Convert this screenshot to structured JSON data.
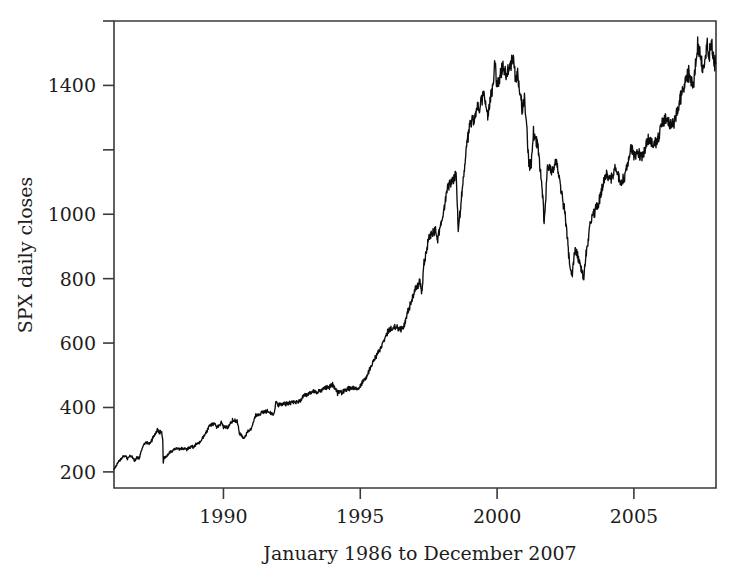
{
  "chart_data": {
    "type": "line",
    "title": "",
    "xlabel": "January 1986 to December 2007",
    "ylabel": "SPX daily closes",
    "grid": false,
    "legend": "none",
    "xlim": [
      1986.0,
      2008.0
    ],
    "ylim": [
      150,
      1600
    ],
    "x_ticks": [
      1990,
      1995,
      2000,
      2005
    ],
    "x_tick_labels": [
      "1990",
      "1995",
      "2000",
      "2005"
    ],
    "y_ticks": [
      200,
      400,
      600,
      800,
      1000,
      1200,
      1400,
      1600
    ],
    "y_tick_labels": [
      "200",
      "400",
      "600",
      "800",
      "1000",
      "",
      "1400",
      ""
    ],
    "series": [
      {
        "name": "SPX daily closes",
        "color": "#0d0d0d",
        "x": [
          1986.0,
          1986.08,
          1986.17,
          1986.25,
          1986.33,
          1986.42,
          1986.5,
          1986.58,
          1986.67,
          1986.75,
          1986.83,
          1986.92,
          1987.0,
          1987.08,
          1987.17,
          1987.25,
          1987.33,
          1987.5,
          1987.58,
          1987.67,
          1987.72,
          1987.78,
          1987.8,
          1987.83,
          1987.92,
          1988.0,
          1988.17,
          1988.33,
          1988.5,
          1988.67,
          1988.83,
          1988.92,
          1989.0,
          1989.17,
          1989.33,
          1989.5,
          1989.67,
          1989.75,
          1989.83,
          1989.92,
          1990.0,
          1990.17,
          1990.33,
          1990.5,
          1990.58,
          1990.75,
          1990.83,
          1990.92,
          1991.0,
          1991.17,
          1991.33,
          1991.5,
          1991.67,
          1991.83,
          1991.92,
          1992.0,
          1992.25,
          1992.5,
          1992.75,
          1992.92,
          1993.0,
          1993.25,
          1993.5,
          1993.75,
          1993.92,
          1994.0,
          1994.17,
          1994.25,
          1994.33,
          1994.5,
          1994.75,
          1994.92,
          1995.0,
          1995.25,
          1995.5,
          1995.75,
          1995.92,
          1996.0,
          1996.25,
          1996.5,
          1996.58,
          1996.75,
          1996.92,
          1997.0,
          1997.17,
          1997.25,
          1997.33,
          1997.5,
          1997.67,
          1997.75,
          1997.83,
          1997.92,
          1998.0,
          1998.17,
          1998.33,
          1998.5,
          1998.58,
          1998.67,
          1998.75,
          1998.83,
          1998.92,
          1999.0,
          1999.17,
          1999.25,
          1999.33,
          1999.5,
          1999.67,
          1999.75,
          1999.83,
          1999.92,
          2000.0,
          2000.17,
          2000.25,
          2000.33,
          2000.42,
          2000.58,
          2000.67,
          2000.75,
          2000.83,
          2000.92,
          2001.0,
          2001.17,
          2001.25,
          2001.33,
          2001.5,
          2001.67,
          2001.72,
          2001.83,
          2001.92,
          2002.0,
          2002.17,
          2002.33,
          2002.5,
          2002.58,
          2002.67,
          2002.75,
          2002.83,
          2002.92,
          2003.0,
          2003.17,
          2003.25,
          2003.42,
          2003.58,
          2003.75,
          2003.92,
          2004.0,
          2004.17,
          2004.33,
          2004.5,
          2004.67,
          2004.83,
          2004.92,
          2005.0,
          2005.17,
          2005.33,
          2005.5,
          2005.67,
          2005.83,
          2005.92,
          2006.0,
          2006.17,
          2006.33,
          2006.42,
          2006.58,
          2006.75,
          2006.92,
          2007.0,
          2007.17,
          2007.33,
          2007.42,
          2007.5,
          2007.58,
          2007.67,
          2007.75,
          2007.83,
          2007.92,
          2007.99
        ],
        "y": [
          209,
          219,
          232,
          238,
          247,
          250,
          240,
          252,
          247,
          235,
          245,
          242,
          264,
          284,
          292,
          288,
          290,
          318,
          333,
          321,
          328,
          305,
          225,
          245,
          247,
          258,
          268,
          273,
          272,
          269,
          278,
          277,
          286,
          294,
          318,
          345,
          349,
          340,
          345,
          353,
          340,
          338,
          361,
          356,
          322,
          304,
          316,
          330,
          330,
          375,
          379,
          388,
          387,
          375,
          417,
          408,
          412,
          415,
          418,
          436,
          438,
          450,
          448,
          463,
          466,
          472,
          445,
          450,
          447,
          458,
          462,
          459,
          465,
          500,
          550,
          585,
          616,
          636,
          650,
          644,
          651,
          701,
          741,
          766,
          790,
          757,
          848,
          925,
          947,
          950,
          914,
          970,
          980,
          1080,
          1100,
          1120,
          957,
          1020,
          1100,
          1164,
          1229,
          1280,
          1300,
          1335,
          1320,
          1380,
          1300,
          1360,
          1390,
          1469,
          1394,
          1450,
          1460,
          1420,
          1450,
          1480,
          1430,
          1440,
          1380,
          1320,
          1366,
          1150,
          1160,
          1255,
          1210,
          1060,
          965,
          1138,
          1148,
          1130,
          1165,
          1080,
          990,
          911,
          825,
          815,
          885,
          880,
          855,
          800,
          875,
          975,
          1008,
          1050,
          1111,
          1131,
          1110,
          1140,
          1100,
          1115,
          1180,
          1211,
          1180,
          1190,
          1180,
          1235,
          1220,
          1230,
          1248,
          1280,
          1300,
          1270,
          1280,
          1310,
          1380,
          1418,
          1438,
          1400,
          1530,
          1490,
          1455,
          1473,
          1525,
          1495,
          1540,
          1470,
          1468
        ]
      }
    ]
  },
  "axes": {
    "y_axis_title": "SPX daily closes",
    "x_axis_title": "January 1986 to December 2007"
  }
}
